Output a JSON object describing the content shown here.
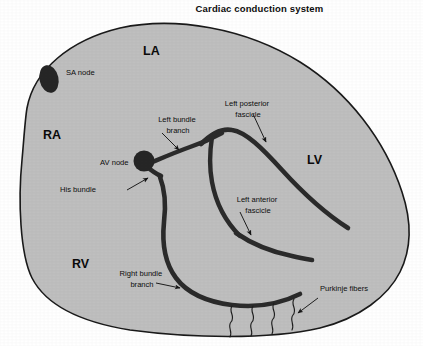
{
  "figure": {
    "title": "Cardiac conduction system",
    "type": "anatomical-diagram"
  },
  "colors": {
    "myocardium_fill": "#bfbfbf",
    "outline": "#1a1a1a",
    "conduction_path": "#2b2b2b",
    "node_fill": "#262626",
    "text": "#0d0d0d",
    "background": "#ffffff"
  },
  "chambers": [
    {
      "id": "la",
      "label": "LA",
      "name": "left-atrium",
      "x": 143,
      "y": 55
    },
    {
      "id": "ra",
      "label": "RA",
      "name": "right-atrium",
      "x": 43,
      "y": 139
    },
    {
      "id": "lv",
      "label": "LV",
      "name": "left-ventricle",
      "x": 307,
      "y": 164
    },
    {
      "id": "rv",
      "label": "RV",
      "name": "right-ventricle",
      "x": 72,
      "y": 268
    }
  ],
  "structures": [
    {
      "id": "sa_node",
      "label": "SA node",
      "name": "sa-node",
      "label_x": 66,
      "label_y": 75,
      "anchor": true,
      "has_arrow": false
    },
    {
      "id": "av_node",
      "label": "AV node",
      "name": "av-node",
      "label_x": 100,
      "label_y": 165,
      "anchor": true,
      "has_arrow": false
    },
    {
      "id": "his_bundle",
      "label": "His bundle",
      "name": "his-bundle",
      "label_x": 91,
      "label_y": 192,
      "has_arrow": true
    },
    {
      "id": "left_bundle_branch",
      "label_line1": "Left bundle",
      "label_line2": "branch",
      "name": "left-bundle-branch",
      "label_x": 144,
      "label_y": 122,
      "has_arrow": true
    },
    {
      "id": "left_posterior_fascicle",
      "label_line1": "Left posterior",
      "label_line2": "fascicle",
      "name": "left-posterior-fascicle",
      "label_x": 212,
      "label_y": 106,
      "has_arrow": true
    },
    {
      "id": "left_anterior_fascicle",
      "label_line1": "Left anterior",
      "label_line2": "fascicle",
      "name": "left-anterior-fascicle",
      "label_x": 235,
      "label_y": 202,
      "has_arrow": true
    },
    {
      "id": "right_bundle_branch",
      "label_line1": "Right bundle",
      "label_line2": "branch",
      "name": "right-bundle-branch",
      "label_x": 114,
      "label_y": 276,
      "has_arrow": true
    },
    {
      "id": "purkinje_fibers",
      "label": "Purkinje fibers",
      "name": "purkinje-fibers",
      "label_x": 309,
      "label_y": 291,
      "has_arrow": true
    }
  ]
}
